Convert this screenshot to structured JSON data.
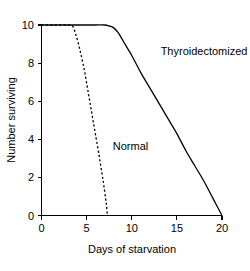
{
  "chart_data": {
    "type": "line",
    "title": "",
    "subtitle": "",
    "xlabel": "Days of starvation",
    "ylabel": "Number surviving",
    "xlim": [
      0,
      20
    ],
    "ylim": [
      0,
      10
    ],
    "xticks": [
      "0",
      "5",
      "10",
      "15",
      "20"
    ],
    "xtick_values": [
      0,
      5,
      10,
      15,
      20
    ],
    "yticks": [
      "0",
      "2",
      "4",
      "6",
      "8",
      "10"
    ],
    "ytick_values": [
      0,
      2,
      4,
      6,
      8,
      10
    ],
    "grid": false,
    "legend": "inline-annotations",
    "series": [
      {
        "name": "Thyroidectomized",
        "style": "solid",
        "color": "#000000",
        "label_position": "upper-right",
        "x": [
          0,
          1,
          2,
          3,
          4,
          5,
          6,
          7,
          7.5,
          8,
          8.5,
          9,
          9.5,
          10,
          11,
          12,
          13,
          14,
          15,
          16,
          17,
          18,
          19,
          20
        ],
        "values": [
          10,
          10,
          10,
          10,
          10,
          10,
          10,
          10,
          9.95,
          9.85,
          9.6,
          9.2,
          8.8,
          8.4,
          7.5,
          6.7,
          5.9,
          5.1,
          4.3,
          3.4,
          2.6,
          1.8,
          0.9,
          0
        ]
      },
      {
        "name": "Normal",
        "style": "dashed",
        "color": "#000000",
        "label_position": "center-left",
        "x": [
          0,
          1,
          2,
          3,
          3.5,
          3.8,
          4.1,
          4.4,
          4.8,
          5.2,
          5.6,
          6.0,
          6.4,
          6.7,
          6.9,
          7.1,
          7.2,
          7.3
        ],
        "values": [
          10,
          10,
          10,
          10,
          9.9,
          9.5,
          9.0,
          8.4,
          7.5,
          6.4,
          5.3,
          4.2,
          3.1,
          2.2,
          1.6,
          0.9,
          0.5,
          0
        ]
      }
    ],
    "annotations": [
      {
        "text": "Thyroidectomized",
        "x": 13.2,
        "y": 8.4
      },
      {
        "text": "Normal",
        "x": 7.9,
        "y": 3.45
      }
    ]
  }
}
